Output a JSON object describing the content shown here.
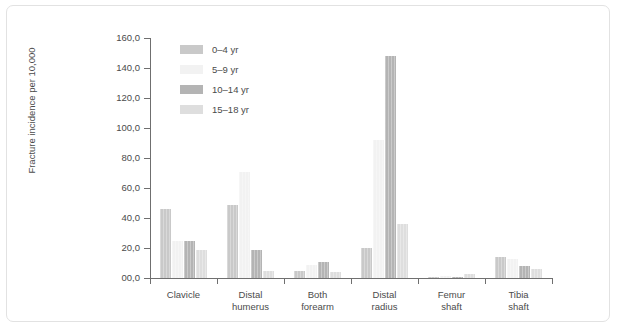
{
  "chart_data": {
    "type": "bar",
    "title": "",
    "xlabel": "",
    "ylabel": "Fracture incidence per 10,000",
    "ylim": [
      0,
      160
    ],
    "ytick_labels": [
      "160,0",
      "140,0",
      "120,0",
      "100,0",
      "80,0",
      "60,0",
      "40,0",
      "20,0",
      "00,0"
    ],
    "ytick_values": [
      160,
      140,
      120,
      100,
      80,
      60,
      40,
      20,
      0
    ],
    "grid": false,
    "legend_position": "top-left",
    "categories": [
      "Clavicle",
      "Distal humerus",
      "Both forearm",
      "Distal radius",
      "Femur shaft",
      "Tibia shaft"
    ],
    "category_lines": [
      [
        "Clavicle",
        ""
      ],
      [
        "Distal",
        "humerus"
      ],
      [
        "Both",
        "forearm"
      ],
      [
        "Distal",
        "radius"
      ],
      [
        "Femur",
        "shaft"
      ],
      [
        "Tibia",
        "shaft"
      ]
    ],
    "series": [
      {
        "name": "0–4 yr",
        "color": "#c9c9c9",
        "values": [
          46,
          49,
          5,
          20,
          1,
          14
        ]
      },
      {
        "name": "5–9 yr",
        "color": "#f2f2f2",
        "values": [
          25,
          71,
          9,
          92,
          1.5,
          13
        ]
      },
      {
        "name": "10–14 yr",
        "color": "#b4b4b4",
        "values": [
          25,
          19,
          11,
          148,
          1,
          8
        ]
      },
      {
        "name": "15–18 yr",
        "color": "#dedede",
        "values": [
          19,
          5,
          4,
          36,
          3,
          6
        ]
      }
    ]
  },
  "colors": {
    "axis": "#6f6f6f",
    "text": "#4b4b4b",
    "frame": "#e2e2e2",
    "background": "#ffffff"
  }
}
